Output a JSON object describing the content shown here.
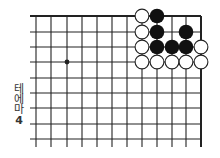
{
  "diagram": {
    "type": "go-board-fragment",
    "label_lines": [
      "테",
      "에",
      "마",
      "4"
    ],
    "grid": {
      "columns_x": [
        36,
        51,
        67,
        82,
        97,
        112,
        127,
        142,
        157,
        172,
        186,
        201
      ],
      "rows_y": [
        16,
        32,
        47,
        62,
        78,
        93,
        108,
        124,
        139
      ],
      "h_line_start_x": 30,
      "v_line_end_y": 147,
      "line_color": "#222222",
      "top_edge": true,
      "right_edge": true
    },
    "star_points": [
      {
        "col": 2,
        "row": 3
      }
    ],
    "stones": [
      {
        "color": "white",
        "col": 7,
        "row": 0
      },
      {
        "color": "black",
        "col": 8,
        "row": 0
      },
      {
        "color": "white",
        "col": 7,
        "row": 1
      },
      {
        "color": "black",
        "col": 8,
        "row": 1
      },
      {
        "color": "black",
        "col": 10,
        "row": 1
      },
      {
        "color": "white",
        "col": 7,
        "row": 2
      },
      {
        "color": "black",
        "col": 8,
        "row": 2
      },
      {
        "color": "black",
        "col": 9,
        "row": 2
      },
      {
        "color": "black",
        "col": 10,
        "row": 2
      },
      {
        "color": "white",
        "col": 11,
        "row": 2
      },
      {
        "color": "white",
        "col": 7,
        "row": 3
      },
      {
        "color": "white",
        "col": 8,
        "row": 3
      },
      {
        "color": "white",
        "col": 9,
        "row": 3
      },
      {
        "color": "white",
        "col": 10,
        "row": 3
      },
      {
        "color": "white",
        "col": 11,
        "row": 3
      }
    ],
    "colors": {
      "black_stone": "#111111",
      "white_stone_fill": "#ffffff",
      "white_stone_stroke": "#222222",
      "background": "#ffffff"
    }
  }
}
